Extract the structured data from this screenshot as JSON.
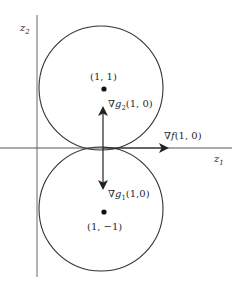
{
  "diagram": {
    "axes": {
      "horizontal_label": "z",
      "horizontal_sub": "1",
      "vertical_label": "z",
      "vertical_sub": "2"
    },
    "circles": [
      {
        "name": "upper",
        "center_label": "(1, 1)"
      },
      {
        "name": "lower",
        "center_label": "(1, −1)"
      }
    ],
    "vectors": {
      "grad_f": {
        "nabla": "∇",
        "fn": "f",
        "args": "(1, 0)"
      },
      "grad_g2": {
        "nabla": "∇",
        "fn": "g",
        "sub": "2",
        "args": "(1, 0)"
      },
      "grad_g1": {
        "nabla": "∇",
        "fn": "g",
        "sub": "1",
        "args": "(1,0)"
      }
    },
    "colors": {
      "stroke": "#333333",
      "axis": "#555555",
      "background": "#ffffff"
    }
  }
}
